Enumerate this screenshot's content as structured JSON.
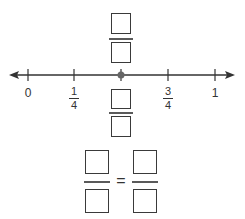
{
  "number_line": {
    "min": 0,
    "max": 1,
    "ticks": [
      {
        "value": 0,
        "label": "0"
      },
      {
        "value": 0.25,
        "label_num": "1",
        "label_den": "4"
      },
      {
        "value": 0.5,
        "label": ""
      },
      {
        "value": 0.75,
        "label_num": "3",
        "label_den": "4"
      },
      {
        "value": 1,
        "label": "1"
      }
    ],
    "point": {
      "value": 0.5,
      "color": "#666666"
    }
  },
  "labels": {
    "zero": "0",
    "one_quarter_num": "1",
    "one_quarter_den": "4",
    "three_quarter_num": "3",
    "three_quarter_den": "4",
    "one": "1"
  },
  "equation": {
    "equals": "="
  }
}
